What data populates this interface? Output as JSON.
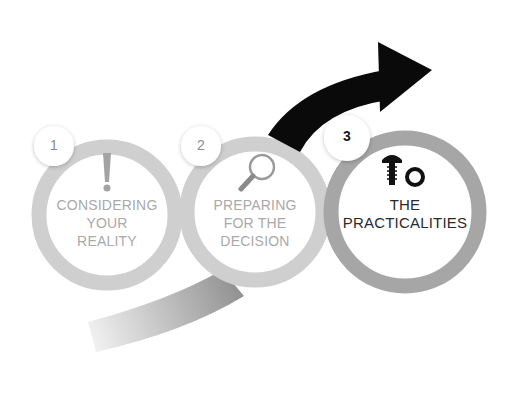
{
  "diagram": {
    "colors": {
      "background": "#ffffff",
      "ring_light": "#cfcfcf",
      "ring_step3": "#a6a6a6",
      "arrow_dark": "#0a0a0a",
      "arrow_fade_start": "#efefef",
      "arrow_fade_end": "#8f8f8f",
      "text_faded": "#a9a9a9",
      "text_active": "#2b2b2b",
      "badge_fill": "#ffffff"
    },
    "arrow": {
      "icon": "curved-arrow-right",
      "direction": "up-right"
    },
    "steps": [
      {
        "number": "1",
        "icon": "exclamation-icon",
        "lines": [
          "CONSIDERING",
          "YOUR",
          "REALITY"
        ],
        "state": "faded"
      },
      {
        "number": "2",
        "icon": "magnifying-glass-icon",
        "lines": [
          "PREPARING",
          "FOR THE",
          "DECISION"
        ],
        "state": "faded"
      },
      {
        "number": "3",
        "icon": "screw-and-nut-icon",
        "lines": [
          "THE",
          "PRACTICALITIES"
        ],
        "state": "active"
      }
    ]
  }
}
